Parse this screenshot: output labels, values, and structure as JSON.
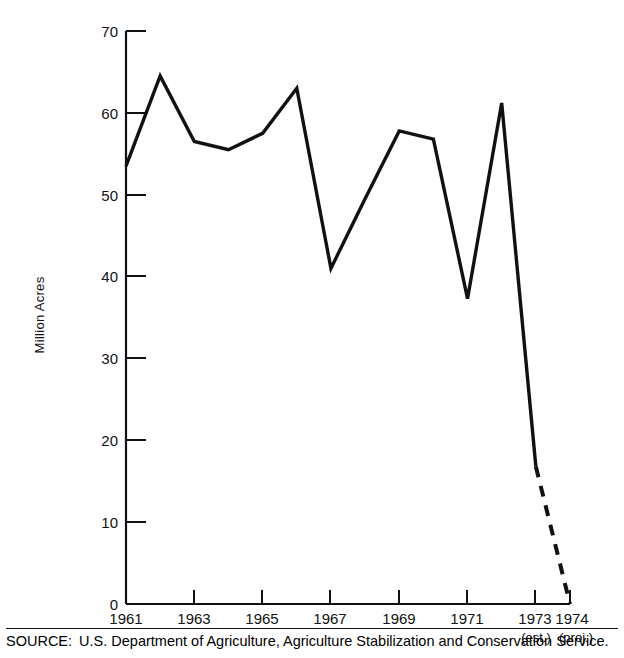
{
  "chart_data": {
    "type": "line",
    "title": "",
    "xlabel": "",
    "ylabel": "Million Acres",
    "xlim": [
      1961,
      1974
    ],
    "ylim": [
      0,
      70
    ],
    "grid": false,
    "legend": null,
    "x": [
      1961,
      1962,
      1963,
      1964,
      1965,
      1966,
      1967,
      1968,
      1969,
      1970,
      1971,
      1972,
      1973,
      1974
    ],
    "values": [
      53.5,
      64.5,
      56.5,
      55.5,
      57.5,
      63.0,
      41.0,
      49.5,
      57.8,
      56.8,
      37.3,
      61.2,
      16.8,
      0.0
    ],
    "series": [
      {
        "name": "Acres diverted",
        "style": "solid",
        "x": [
          1961,
          1962,
          1963,
          1964,
          1965,
          1966,
          1967,
          1968,
          1969,
          1970,
          1971,
          1972,
          1973
        ],
        "values": [
          53.5,
          64.5,
          56.5,
          55.5,
          57.5,
          63.0,
          41.0,
          49.5,
          57.8,
          56.8,
          37.3,
          61.2,
          16.8
        ]
      },
      {
        "name": "Projection",
        "style": "dashed",
        "x": [
          1973,
          1974
        ],
        "values": [
          16.8,
          0.0
        ]
      }
    ],
    "ytick_labels": [
      "0",
      "10",
      "20",
      "30",
      "40",
      "50",
      "60",
      "70"
    ],
    "ytick_values": [
      0,
      10,
      20,
      30,
      40,
      50,
      60,
      70
    ],
    "xtick_labels": [
      "1961",
      "1963",
      "1965",
      "1967",
      "1969",
      "1971",
      "1973",
      "1974"
    ],
    "xtick_values": [
      1961,
      1963,
      1965,
      1967,
      1969,
      1971,
      1973,
      1974
    ],
    "xtick_sublabels": [
      "",
      "",
      "",
      "",
      "",
      "",
      "(est.)",
      "(proj.)"
    ],
    "line_color": "#111111"
  },
  "source": {
    "label": "SOURCE:",
    "text": "U.S. Department of Agriculture, Agriculture Stabilization and Conservation Service."
  }
}
